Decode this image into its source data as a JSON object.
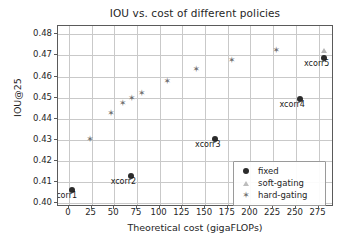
{
  "chart_data": {
    "type": "scatter",
    "title": "IOU vs. cost of different policies",
    "xlabel": "Theoretical cost (gigaFLOPs)",
    "ylabel": "IOU@25",
    "xlim": [
      -12,
      292
    ],
    "ylim": [
      0.398,
      0.484
    ],
    "xticks": [
      0,
      25,
      50,
      75,
      100,
      125,
      150,
      175,
      200,
      225,
      250,
      275
    ],
    "yticks": [
      "0.40",
      "0.41",
      "0.42",
      "0.43",
      "0.44",
      "0.45",
      "0.46",
      "0.47",
      "0.48"
    ],
    "grid": true,
    "legend_position": "lower right",
    "series": [
      {
        "name": "fixed",
        "marker": "circle",
        "color": "#2b2b2b",
        "points": [
          {
            "x": 3,
            "y": 0.4062,
            "label": "xcorr1"
          },
          {
            "x": 68,
            "y": 0.4127,
            "label": "xcorr2"
          },
          {
            "x": 161,
            "y": 0.4305,
            "label": "xcorr3"
          },
          {
            "x": 254,
            "y": 0.4493,
            "label": "xcorr4"
          },
          {
            "x": 281,
            "y": 0.469,
            "label": "xcorr5"
          }
        ]
      },
      {
        "name": "soft-gating",
        "marker": "triangle",
        "color": "#bdbdbd",
        "points": [
          {
            "x": 281,
            "y": 0.4722,
            "label": ""
          }
        ]
      },
      {
        "name": "hard-gating",
        "marker": "star",
        "color": "#6f6f6f",
        "points": [
          {
            "x": 23,
            "y": 0.4303,
            "label": ""
          },
          {
            "x": 46,
            "y": 0.4427,
            "label": ""
          },
          {
            "x": 59,
            "y": 0.4475,
            "label": ""
          },
          {
            "x": 69,
            "y": 0.45,
            "label": ""
          },
          {
            "x": 80,
            "y": 0.4522,
            "label": ""
          },
          {
            "x": 108,
            "y": 0.458,
            "label": ""
          },
          {
            "x": 140,
            "y": 0.4635,
            "label": ""
          },
          {
            "x": 179,
            "y": 0.4677,
            "label": ""
          },
          {
            "x": 228,
            "y": 0.4727,
            "label": ""
          }
        ]
      }
    ]
  },
  "legend": {
    "entries": [
      {
        "label": "fixed",
        "marker": "circle"
      },
      {
        "label": "soft-gating",
        "marker": "triangle"
      },
      {
        "label": "hard-gating",
        "marker": "star"
      }
    ]
  },
  "glyphs": {
    "star": "✶"
  }
}
